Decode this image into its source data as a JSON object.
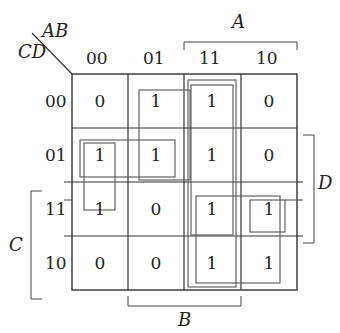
{
  "kmap": {
    "corner": {
      "row_vars": "CD",
      "col_vars": "AB"
    },
    "col_headers": [
      "00",
      "01",
      "11",
      "10"
    ],
    "row_headers": [
      "00",
      "01",
      "11",
      "10"
    ],
    "cells": [
      [
        "0",
        "1",
        "1",
        "0"
      ],
      [
        "1",
        "1",
        "1",
        "0"
      ],
      [
        "1",
        "0",
        "1",
        "1"
      ],
      [
        "0",
        "0",
        "1",
        "1"
      ]
    ],
    "brackets": {
      "A": "A",
      "B": "B",
      "C": "C",
      "D": "D"
    }
  }
}
